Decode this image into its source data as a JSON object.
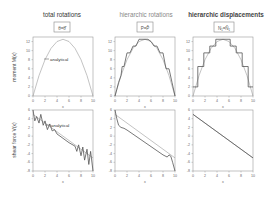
{
  "figure": {
    "columns": [
      {
        "title": "total rotations",
        "box_label": "θ=θ̂"
      },
      {
        "title": "hierarchic rotations",
        "box_label": "P=P̂"
      },
      {
        "title": "hierarchic displacements",
        "box_label": "N₁=N̂₁"
      }
    ],
    "annotations": {
      "analytical": "analytical"
    },
    "colors": {
      "curve": "#555555",
      "axis": "#999999",
      "text": "#333333"
    }
  },
  "chart_data": [
    {
      "type": "line",
      "panel": "top-left",
      "title": "total rotations",
      "xlabel": "x",
      "ylabel": "moment M(x)",
      "xlim": [
        0,
        10
      ],
      "ylim": [
        0,
        13
      ],
      "xticks": [
        0,
        2,
        4,
        6,
        8,
        10
      ],
      "yticks": [
        0,
        2,
        4,
        6,
        8,
        10,
        12
      ],
      "annotation": "analytical",
      "series": [
        {
          "name": "analytical",
          "x": [
            0,
            1,
            2,
            3,
            4,
            5,
            6,
            7,
            8,
            9,
            10
          ],
          "y": [
            0,
            4.5,
            8,
            10.5,
            12,
            12.5,
            12,
            10.5,
            8,
            4.5,
            0
          ]
        }
      ]
    },
    {
      "type": "line",
      "panel": "top-middle",
      "title": "hierarchic rotations",
      "xlabel": "x",
      "ylabel": "",
      "xlim": [
        0,
        10
      ],
      "ylim": [
        0,
        13
      ],
      "xticks": [
        0,
        2,
        4,
        6,
        8,
        10
      ],
      "yticks": [
        0,
        2,
        4,
        6,
        8,
        10,
        12
      ],
      "series": [
        {
          "name": "analytical",
          "x": [
            0,
            1,
            2,
            3,
            4,
            5,
            6,
            7,
            8,
            9,
            10
          ],
          "y": [
            0,
            4.5,
            8,
            10.5,
            12,
            12.5,
            12,
            10.5,
            8,
            4.5,
            0
          ]
        },
        {
          "name": "approximation",
          "x": [
            0,
            0.3,
            0.6,
            1,
            1.2,
            1.5,
            2,
            2.5,
            3,
            3.5,
            4,
            4.5,
            5,
            5.5,
            6,
            6.5,
            7,
            7.5,
            8,
            8.5,
            9,
            9.5,
            10
          ],
          "y": [
            0,
            1.5,
            3,
            4.5,
            6.5,
            6.5,
            9.5,
            9.5,
            11,
            11,
            12.5,
            12.5,
            12.5,
            12.5,
            12,
            11,
            11,
            9.5,
            9.5,
            6,
            6,
            3,
            0
          ]
        }
      ]
    },
    {
      "type": "line",
      "panel": "top-right",
      "title": "hierarchic displacements",
      "xlabel": "x",
      "ylabel": "",
      "xlim": [
        0,
        10
      ],
      "ylim": [
        0,
        13
      ],
      "xticks": [
        0,
        2,
        4,
        6,
        8,
        10
      ],
      "yticks": [
        0,
        2,
        4,
        6,
        8,
        10,
        12
      ],
      "series": [
        {
          "name": "analytical",
          "x": [
            0,
            1,
            2,
            3,
            4,
            5,
            6,
            7,
            8,
            9,
            10
          ],
          "y": [
            0,
            4.5,
            8,
            10.5,
            12,
            12.5,
            12,
            10.5,
            8,
            4.5,
            0
          ]
        },
        {
          "name": "approximation (steps)",
          "x": [
            0,
            0.8,
            0.8,
            1.8,
            1.8,
            2.8,
            2.8,
            3.8,
            3.8,
            6.2,
            6.2,
            7.2,
            7.2,
            8.2,
            8.2,
            9.2,
            9.2,
            10
          ],
          "y": [
            2,
            2,
            6.5,
            6.5,
            9.5,
            9.5,
            11,
            11,
            12.5,
            12.5,
            11,
            11,
            9.5,
            9.5,
            6.5,
            6.5,
            2,
            2
          ]
        }
      ]
    },
    {
      "type": "line",
      "panel": "bottom-left",
      "title": "",
      "xlabel": "x",
      "ylabel": "shear force V(x)",
      "xlim": [
        0,
        10
      ],
      "ylim": [
        -8,
        6
      ],
      "xticks": [
        0,
        2,
        4,
        6,
        8,
        10
      ],
      "yticks": [
        6,
        4,
        2,
        0,
        -2,
        -4,
        -6,
        -8
      ],
      "annotation": "analytical",
      "series": [
        {
          "name": "analytical",
          "x": [
            0,
            10
          ],
          "y": [
            5,
            -5
          ]
        },
        {
          "name": "approximation (oscillating)",
          "x": [
            0,
            0.3,
            0.6,
            1,
            1.3,
            1.7,
            2,
            2.4,
            2.8,
            3.2,
            3.6,
            4,
            5,
            6,
            7,
            7.3,
            7.6,
            8,
            8.3,
            8.6,
            9,
            9.3,
            9.6,
            10
          ],
          "y": [
            6,
            3.5,
            4.5,
            3,
            5,
            2.5,
            3.5,
            1.5,
            2.8,
            1.2,
            1.5,
            0.5,
            -0.5,
            -1.5,
            -2.3,
            -3.5,
            -2,
            -4.5,
            -2.5,
            -5.5,
            -3,
            -6.5,
            -3.5,
            -8
          ]
        }
      ]
    },
    {
      "type": "line",
      "panel": "bottom-middle",
      "title": "",
      "xlabel": "x",
      "ylabel": "",
      "xlim": [
        0,
        10
      ],
      "ylim": [
        -8,
        6
      ],
      "xticks": [
        0,
        2,
        4,
        6,
        8,
        10
      ],
      "yticks": [
        6,
        4,
        2,
        0,
        -2,
        -4,
        -6,
        -8
      ],
      "series": [
        {
          "name": "analytical",
          "x": [
            0,
            10
          ],
          "y": [
            5,
            -5
          ]
        },
        {
          "name": "approximation",
          "x": [
            0,
            0.3,
            0.6,
            1,
            1.5,
            2,
            4,
            6,
            8,
            8.7,
            9,
            9.3,
            9.6,
            10
          ],
          "y": [
            6,
            4,
            2.5,
            2,
            1.8,
            1.4,
            -0.5,
            -2.4,
            -4.3,
            -4.8,
            -4.3,
            -4.6,
            -6,
            -8
          ]
        }
      ]
    },
    {
      "type": "line",
      "panel": "bottom-right",
      "title": "",
      "xlabel": "x",
      "ylabel": "",
      "xlim": [
        0,
        10
      ],
      "ylim": [
        -8,
        6
      ],
      "xticks": [
        0,
        2,
        4,
        6,
        8,
        10
      ],
      "yticks": [
        6,
        4,
        2,
        0,
        -2,
        -4,
        -6,
        -8
      ],
      "series": [
        {
          "name": "analytical",
          "x": [
            0,
            10
          ],
          "y": [
            5,
            -5
          ]
        },
        {
          "name": "approximation",
          "x": [
            0,
            10
          ],
          "y": [
            5,
            -5
          ]
        }
      ]
    }
  ]
}
